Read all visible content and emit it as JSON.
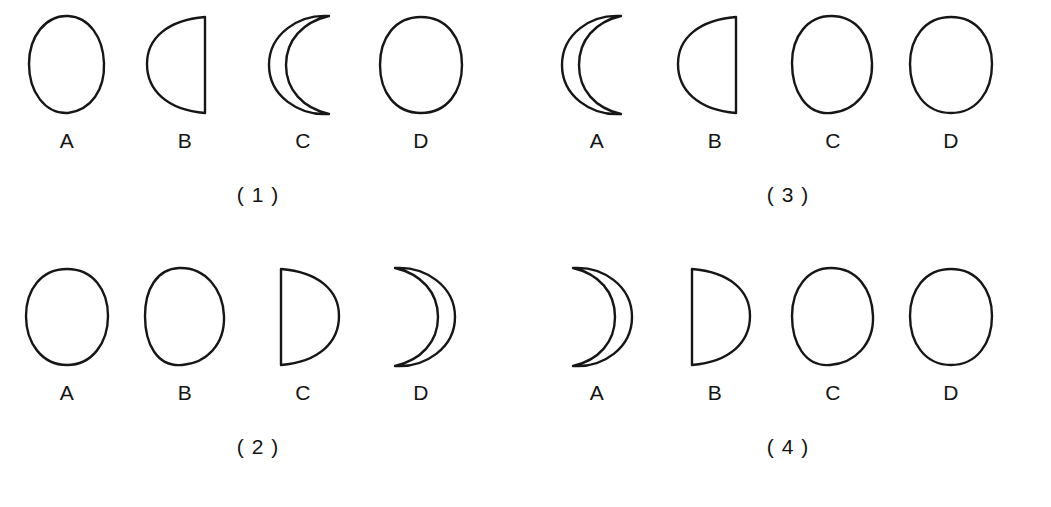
{
  "figure": {
    "background_color": "#ffffff",
    "ink_color": "#161616"
  },
  "groups": [
    {
      "caption": "( 1 )",
      "number": "1",
      "phases": [
        {
          "label": "A",
          "shape": "full-moon",
          "icon": "full-moon-icon"
        },
        {
          "label": "B",
          "shape": "half-moon-flat-right",
          "icon": "half-moon-left-icon"
        },
        {
          "label": "C",
          "shape": "crescent-open-right",
          "icon": "crescent-left-icon"
        },
        {
          "label": "D",
          "shape": "full-moon",
          "icon": "full-moon-icon"
        }
      ]
    },
    {
      "caption": "( 2 )",
      "number": "2",
      "phases": [
        {
          "label": "A",
          "shape": "full-moon",
          "icon": "full-moon-icon"
        },
        {
          "label": "B",
          "shape": "full-moon",
          "icon": "full-moon-icon"
        },
        {
          "label": "C",
          "shape": "half-moon-flat-left",
          "icon": "half-moon-right-icon"
        },
        {
          "label": "D",
          "shape": "crescent-open-left",
          "icon": "crescent-right-icon"
        }
      ]
    },
    {
      "caption": "( 3 )",
      "number": "3",
      "phases": [
        {
          "label": "A",
          "shape": "crescent-open-right",
          "icon": "crescent-left-icon"
        },
        {
          "label": "B",
          "shape": "half-moon-flat-right",
          "icon": "half-moon-left-icon"
        },
        {
          "label": "C",
          "shape": "full-moon",
          "icon": "full-moon-icon"
        },
        {
          "label": "D",
          "shape": "full-moon",
          "icon": "full-moon-icon"
        }
      ]
    },
    {
      "caption": "( 4 )",
      "number": "4",
      "phases": [
        {
          "label": "A",
          "shape": "crescent-open-left",
          "icon": "crescent-right-icon"
        },
        {
          "label": "B",
          "shape": "half-moon-flat-left",
          "icon": "half-moon-right-icon"
        },
        {
          "label": "C",
          "shape": "full-moon",
          "icon": "full-moon-icon"
        },
        {
          "label": "D",
          "shape": "full-moon",
          "icon": "full-moon-icon"
        }
      ]
    }
  ]
}
